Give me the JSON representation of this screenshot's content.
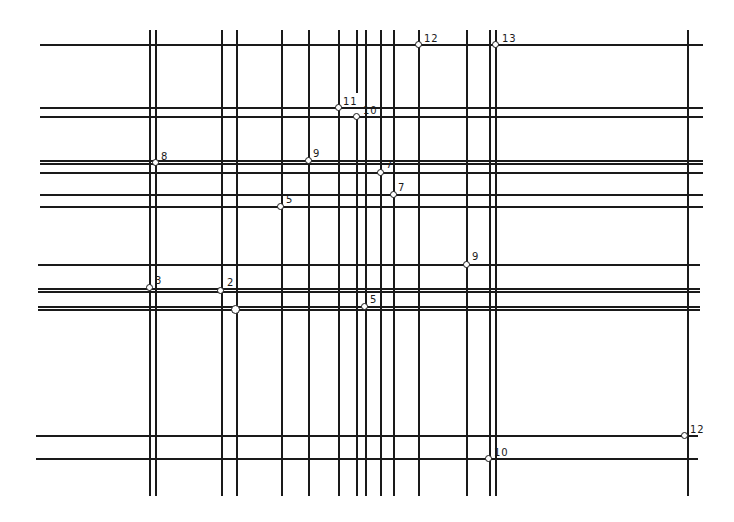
{
  "diagram": {
    "type": "grid-line network",
    "vertical_lines": [
      {
        "x": 150,
        "y1": 30,
        "y2": 496,
        "w": 1.5
      },
      {
        "x": 156,
        "y1": 30,
        "y2": 496,
        "w": 1.5
      },
      {
        "x": 222,
        "y1": 30,
        "y2": 496,
        "w": 1.5
      },
      {
        "x": 237,
        "y1": 30,
        "y2": 496,
        "w": 2
      },
      {
        "x": 282,
        "y1": 30,
        "y2": 496,
        "w": 1.5
      },
      {
        "x": 309,
        "y1": 30,
        "y2": 496,
        "w": 1.5
      },
      {
        "x": 339,
        "y1": 30,
        "y2": 496,
        "w": 1.5
      },
      {
        "x": 357,
        "y1": 30,
        "y2": 93,
        "w": 1.5
      },
      {
        "x": 357,
        "y1": 117,
        "y2": 496,
        "w": 1.5
      },
      {
        "x": 366,
        "y1": 30,
        "y2": 496,
        "w": 1.5
      },
      {
        "x": 381,
        "y1": 30,
        "y2": 496,
        "w": 1.5
      },
      {
        "x": 394,
        "y1": 30,
        "y2": 496,
        "w": 1.5
      },
      {
        "x": 419,
        "y1": 30,
        "y2": 496,
        "w": 1.5
      },
      {
        "x": 467,
        "y1": 30,
        "y2": 496,
        "w": 1.5
      },
      {
        "x": 490,
        "y1": 30,
        "y2": 496,
        "w": 1.5
      },
      {
        "x": 496,
        "y1": 30,
        "y2": 496,
        "w": 1.5
      },
      {
        "x": 688,
        "y1": 30,
        "y2": 496,
        "w": 1.5
      }
    ],
    "horizontal_lines": [
      {
        "y": 45,
        "x1": 40,
        "x2": 703,
        "w": 1.5
      },
      {
        "y": 108,
        "x1": 40,
        "x2": 703,
        "w": 1.5
      },
      {
        "y": 117,
        "x1": 40,
        "x2": 703,
        "w": 1.5
      },
      {
        "y": 161,
        "x1": 40,
        "x2": 703,
        "w": 1.5
      },
      {
        "y": 164,
        "x1": 40,
        "x2": 703,
        "w": 1.5
      },
      {
        "y": 173,
        "x1": 40,
        "x2": 703,
        "w": 1.5
      },
      {
        "y": 195,
        "x1": 40,
        "x2": 703,
        "w": 1.5
      },
      {
        "y": 207,
        "x1": 40,
        "x2": 703,
        "w": 1.5
      },
      {
        "y": 265,
        "x1": 38,
        "x2": 700,
        "w": 1.5
      },
      {
        "y": 289,
        "x1": 38,
        "x2": 700,
        "w": 1.5
      },
      {
        "y": 292,
        "x1": 38,
        "x2": 700,
        "w": 1.5
      },
      {
        "y": 307,
        "x1": 38,
        "x2": 700,
        "w": 1.5
      },
      {
        "y": 310,
        "x1": 38,
        "x2": 700,
        "w": 1.5
      },
      {
        "y": 436,
        "x1": 36,
        "x2": 698,
        "w": 1.5
      },
      {
        "y": 459,
        "x1": 36,
        "x2": 698,
        "w": 1.5
      }
    ],
    "nodes": [
      {
        "x": 419,
        "y": 45,
        "label": "12",
        "lx": 424,
        "ly": 34,
        "big": false
      },
      {
        "x": 496,
        "y": 45,
        "label": "13",
        "lx": 502,
        "ly": 34,
        "big": false
      },
      {
        "x": 339,
        "y": 108,
        "label": "11",
        "lx": 343,
        "ly": 97,
        "big": false
      },
      {
        "x": 357,
        "y": 117,
        "label": "10",
        "lx": 363,
        "ly": 106,
        "big": false
      },
      {
        "x": 156,
        "y": 163,
        "label": "8",
        "lx": 161,
        "ly": 152,
        "big": false
      },
      {
        "x": 309,
        "y": 161,
        "label": "9",
        "lx": 313,
        "ly": 149,
        "big": false
      },
      {
        "x": 381,
        "y": 173,
        "label": "7",
        "lx": 386,
        "ly": 160,
        "big": false
      },
      {
        "x": 394,
        "y": 195,
        "label": "7",
        "lx": 398,
        "ly": 183,
        "big": false
      },
      {
        "x": 281,
        "y": 207,
        "label": "5",
        "lx": 286,
        "ly": 195,
        "big": false
      },
      {
        "x": 467,
        "y": 265,
        "label": "9",
        "lx": 472,
        "ly": 252,
        "big": false
      },
      {
        "x": 150,
        "y": 288,
        "label": "3",
        "lx": 155,
        "ly": 276,
        "big": false
      },
      {
        "x": 221,
        "y": 291,
        "label": "2",
        "lx": 227,
        "ly": 278,
        "big": false
      },
      {
        "x": 236,
        "y": 310,
        "label": "",
        "lx": 0,
        "ly": 0,
        "big": true
      },
      {
        "x": 365,
        "y": 307,
        "label": "5",
        "lx": 370,
        "ly": 295,
        "big": false
      },
      {
        "x": 685,
        "y": 436,
        "label": "12",
        "lx": 690,
        "ly": 425,
        "big": false
      },
      {
        "x": 489,
        "y": 459,
        "label": "10",
        "lx": 494,
        "ly": 448,
        "big": false
      }
    ],
    "node_labels": [
      "12",
      "13",
      "11",
      "10",
      "8",
      "9",
      "7",
      "7",
      "5",
      "9",
      "3",
      "2",
      "5",
      "12",
      "10"
    ]
  }
}
